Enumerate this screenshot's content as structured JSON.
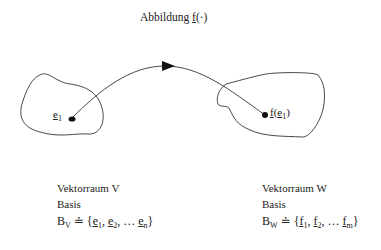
{
  "title": {
    "prefix": "Abbildung ",
    "func": "f",
    "args": "(·)"
  },
  "left": {
    "point_label_base": "e",
    "point_label_sub": "1",
    "space_label": "Vektorraum V",
    "basis_label": "Basis",
    "basis_symbol": "B",
    "basis_symbol_sub": "V",
    "relation": "≐",
    "basis_open": "{",
    "basis_elements": [
      {
        "base": "e",
        "sub": "1"
      },
      {
        "base": "e",
        "sub": "2"
      },
      {
        "base": "e",
        "sub": "n"
      }
    ],
    "separator": ", ",
    "ellipsis": "…",
    "basis_close": "}"
  },
  "right": {
    "point_label_func": "f",
    "point_label_arg_base": "e",
    "point_label_arg_sub": "1",
    "space_label": "Vektorraum W",
    "basis_label": "Basis",
    "basis_symbol": "B",
    "basis_symbol_sub": "W",
    "relation": "≐",
    "basis_open": "{",
    "basis_elements": [
      {
        "base": "f",
        "sub": "1"
      },
      {
        "base": "f",
        "sub": "2"
      },
      {
        "base": "f",
        "sub": "m"
      }
    ],
    "separator": ", ",
    "ellipsis": "…",
    "basis_close": "}"
  },
  "colors": {
    "stroke": "#333333",
    "text": "#222222"
  }
}
